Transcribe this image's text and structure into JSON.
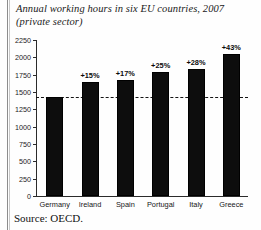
{
  "figure": {
    "title": "Annual working hours in six EU countries, 2007 (private sector)",
    "source": "Source: OECD."
  },
  "chart_data": {
    "type": "bar",
    "title": "Annual working hours in six EU countries, 2007 (private sector)",
    "xlabel": "",
    "ylabel": "",
    "ylim": [
      0,
      2250
    ],
    "grid": false,
    "legend": null,
    "categories": [
      "Germany",
      "Ireland",
      "Spain",
      "Portugal",
      "Italy",
      "Greece"
    ],
    "values": [
      1430,
      1640,
      1670,
      1790,
      1830,
      2045
    ],
    "bar_labels": [
      "",
      "+15%",
      "+17%",
      "+25%",
      "+28%",
      "+43%"
    ],
    "yticks": [
      0,
      250,
      500,
      750,
      1000,
      1250,
      1500,
      1750,
      2000,
      2250
    ],
    "ytick_labels": [
      "0",
      "250",
      "500",
      "750",
      "1000",
      "1250",
      "1500",
      "1750",
      "2000",
      "2250"
    ],
    "reference_line": {
      "value": 1430,
      "style": "dashed",
      "label": ""
    },
    "bar_color": "#0d0d0d",
    "annotation_note": "Percentages show increase relative to Germany"
  }
}
